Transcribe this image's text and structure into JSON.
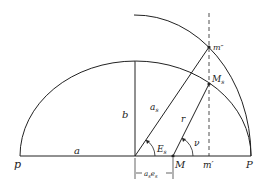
{
  "diagram": {
    "type": "geometry",
    "labels": {
      "p": "p",
      "a": "a",
      "b": "b",
      "a_s": "a",
      "a_s_sub": "s",
      "E_s": "E",
      "E_s_sub": "s",
      "r": "r",
      "nu": "ν",
      "M": "M",
      "m_prime": "m′",
      "P": "P",
      "m_double_prime": "m″",
      "M_s": "M",
      "M_s_sub": "s",
      "ae": "a",
      "ae_sub1": "s",
      "ae_e": "e",
      "ae_sub2": "s"
    },
    "colors": {
      "stroke": "#222222",
      "background": "#ffffff"
    }
  }
}
